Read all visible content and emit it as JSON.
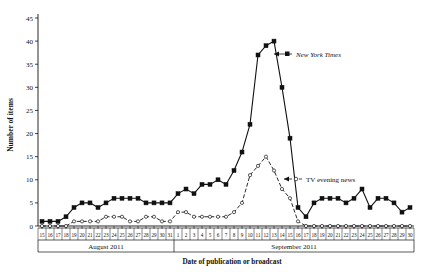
{
  "chart_data": {
    "type": "line",
    "title": "",
    "xlabel": "Date of publication or broadcast",
    "ylabel": "Number of items",
    "ylim": [
      0,
      45
    ],
    "ytick_step": 5,
    "yticks": [
      0,
      5,
      10,
      15,
      20,
      25,
      30,
      35,
      40,
      45
    ],
    "grid": false,
    "legend_position": "inline-annotation",
    "x": [
      "15",
      "16",
      "17",
      "18",
      "19",
      "20",
      "21",
      "22",
      "23",
      "24",
      "25",
      "26",
      "27",
      "28",
      "29",
      "30",
      "31",
      "1",
      "2",
      "3",
      "4",
      "5",
      "6",
      "7",
      "8",
      "9",
      "10",
      "11",
      "12",
      "13",
      "14",
      "15",
      "16",
      "17",
      "18",
      "19",
      "20",
      "21",
      "22",
      "23",
      "24",
      "25",
      "26",
      "27",
      "28",
      "29",
      "30"
    ],
    "month_groups": [
      {
        "label": "August 2011",
        "start_index": 0,
        "end_index": 16
      },
      {
        "label": "September 2011",
        "start_index": 17,
        "end_index": 46
      }
    ],
    "series": [
      {
        "name": "New York Times",
        "marker": "filled-square",
        "line_style": "solid",
        "color": "#111111",
        "values": [
          1,
          1,
          1,
          2,
          4,
          5,
          5,
          4,
          5,
          6,
          6,
          6,
          6,
          5,
          5,
          5,
          5,
          7,
          8,
          7,
          9,
          9,
          10,
          9,
          12,
          16,
          22,
          37,
          39,
          40,
          30,
          19,
          4,
          2,
          5,
          6,
          6,
          6,
          5,
          6,
          8,
          4,
          6,
          6,
          5,
          3,
          4
        ]
      },
      {
        "name": "TV evening news",
        "marker": "open-circle",
        "line_style": "dashed",
        "color": "#111111",
        "values": [
          0,
          0,
          0,
          0,
          1,
          1,
          1,
          1,
          2,
          2,
          2,
          1,
          1,
          2,
          2,
          1,
          1,
          3,
          3,
          2,
          2,
          2,
          2,
          2,
          3,
          5,
          11,
          13,
          15,
          12,
          8,
          6,
          1,
          0,
          0,
          0,
          0,
          0,
          0,
          0,
          0,
          0,
          0,
          0,
          0,
          0,
          0
        ]
      }
    ],
    "annotations": [
      {
        "text": "New York Times",
        "style": "italic"
      },
      {
        "text": "TV evening news",
        "style": "regular"
      }
    ]
  }
}
